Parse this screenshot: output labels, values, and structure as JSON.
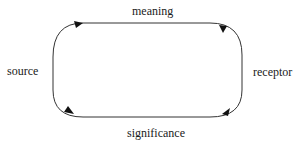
{
  "diagram": {
    "type": "cycle",
    "nodes": {
      "top": "meaning",
      "left": "source",
      "right": "receptor",
      "bottom": "significance"
    },
    "edges": [
      {
        "from": "source",
        "to": "meaning",
        "position": "top-left"
      },
      {
        "from": "receptor",
        "to": "meaning",
        "position": "top-right"
      },
      {
        "from": "source",
        "to": "significance",
        "position": "bottom-left"
      },
      {
        "from": "significance",
        "to": "receptor",
        "position": "bottom-right"
      }
    ],
    "colors": {
      "stroke": "#333333",
      "text": "#1a1a1a",
      "background": "#ffffff"
    }
  }
}
